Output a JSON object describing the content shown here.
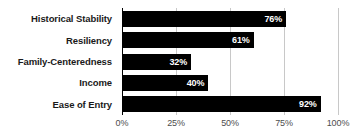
{
  "chart_data": {
    "type": "bar",
    "orientation": "horizontal",
    "title": "",
    "subtitle": "",
    "xlabel": "",
    "ylabel": "",
    "categories": [
      "Historical Stability",
      "Resiliency",
      "Family-Centeredness",
      "Income",
      "Ease of Entry"
    ],
    "values": [
      76,
      61,
      32,
      40,
      92
    ],
    "data_labels": [
      "76%",
      "61%",
      "32%",
      "40%",
      "92%"
    ],
    "xlim": [
      0,
      100
    ],
    "xticks": [
      0,
      25,
      50,
      75,
      100
    ],
    "xtick_labels": [
      "0%",
      "25%",
      "50%",
      "75%",
      "100%"
    ],
    "grid": true,
    "legend": false,
    "bar_color": "#000000",
    "data_label_color": "#ffffff",
    "gridline_color": "#c8c8c8",
    "axis_color": "#000000",
    "background_color": "#ffffff"
  }
}
